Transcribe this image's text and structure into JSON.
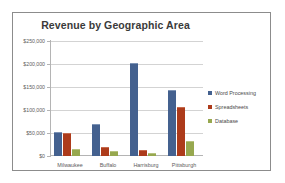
{
  "chart_data": {
    "type": "bar",
    "title": "Revenue by Geographic Area",
    "xlabel": "",
    "ylabel": "",
    "categories": [
      "Milwaukee",
      "Buffalo",
      "Harrisburg",
      "Pittsburgh"
    ],
    "series": [
      {
        "name": "Word Processing",
        "color": "#44618f",
        "values": [
          50000,
          67000,
          200000,
          142000
        ]
      },
      {
        "name": "Spreadsheets",
        "color": "#ad3b1b",
        "values": [
          47000,
          17000,
          11000,
          105000
        ]
      },
      {
        "name": "Database",
        "color": "#97a84f",
        "values": [
          12000,
          8000,
          5000,
          30000
        ]
      }
    ],
    "ylim": [
      0,
      250000
    ],
    "ytick_values": [
      0,
      50000,
      100000,
      150000,
      200000,
      250000
    ],
    "ytick_labels": [
      "$0",
      "$50,000",
      "$100,000",
      "$150,000",
      "$200,000",
      "$250,000"
    ],
    "grid": true,
    "legend_position": "right"
  }
}
